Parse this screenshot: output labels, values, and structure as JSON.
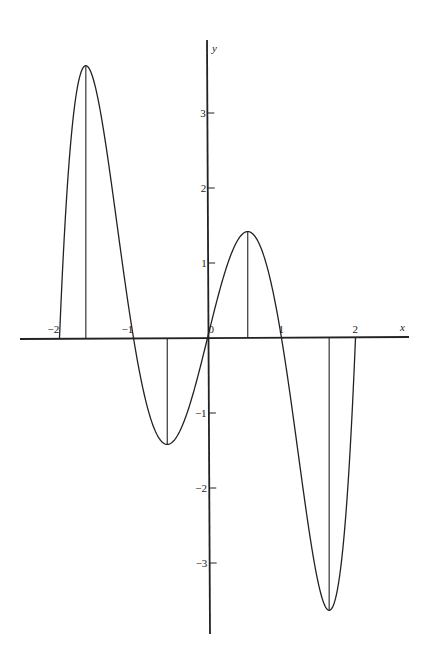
{
  "chart_data": {
    "type": "line",
    "title": "",
    "function": "y = x(x^2 - 1)(x^2 - 4)",
    "xlabel": "x",
    "ylabel": "y",
    "xlim": [
      -2.5,
      2.7
    ],
    "ylim": [
      -4,
      4.1
    ],
    "x_ticks": [
      -2,
      -1,
      0,
      1,
      2
    ],
    "x_tick_labels": [
      "−2",
      "−1",
      "0",
      "1",
      "2"
    ],
    "y_ticks": [
      -3,
      -2,
      -1,
      1,
      2,
      3
    ],
    "y_tick_labels": [
      "−3",
      "−2",
      "−1",
      "1",
      "2",
      "3"
    ],
    "grid": false,
    "legend": null,
    "domain": [
      -2,
      2
    ],
    "roots": [
      -2,
      -1,
      0,
      1,
      2
    ],
    "extrema": [
      {
        "x": -1.644,
        "y": 3.631,
        "kind": "max"
      },
      {
        "x": -0.544,
        "y": -1.419,
        "kind": "min"
      },
      {
        "x": 0.544,
        "y": 1.419,
        "kind": "max"
      },
      {
        "x": 1.644,
        "y": -3.631,
        "kind": "min"
      }
    ],
    "vertical_segments_x": [
      -2,
      -1.644,
      -0.544,
      0.544,
      1.644,
      2
    ],
    "series": [
      {
        "name": "f(x)",
        "x": [
          -2,
          -1.8,
          -1.644,
          -1.5,
          -1.25,
          -1,
          -0.75,
          -0.544,
          -0.25,
          0,
          0.25,
          0.544,
          0.75,
          1,
          1.25,
          1.5,
          1.644,
          1.8,
          2
        ],
        "y": [
          0,
          3.073,
          3.631,
          3.281,
          1.582,
          0,
          -1.248,
          -1.419,
          -0.874,
          0,
          0.874,
          1.419,
          1.248,
          0,
          -1.582,
          -3.281,
          -3.631,
          -3.073,
          0
        ]
      }
    ]
  }
}
